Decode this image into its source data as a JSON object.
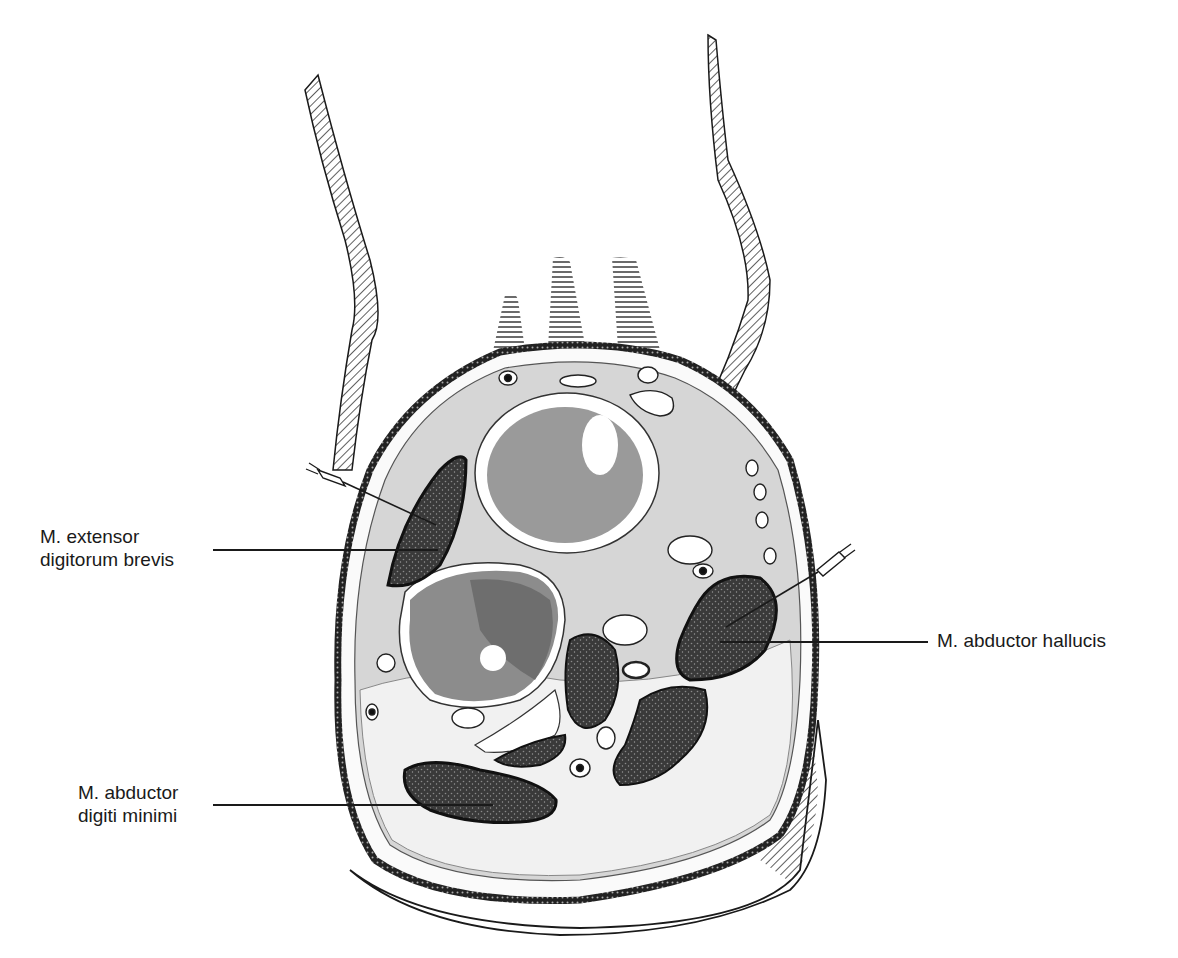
{
  "figure": {
    "colors": {
      "ink": "#1a1a1a",
      "muscle_fill": "#3a3a3a",
      "bone_fill": "#9a9a9a",
      "bone_dark": "#6e6e6e",
      "tissue_fill": "#d4d4d4",
      "fat_fill": "#f2f2f2",
      "background": "#ffffff"
    }
  },
  "labels": [
    {
      "id": "edb",
      "lines": [
        "M. extensor",
        "digitorum brevis"
      ]
    },
    {
      "id": "ah",
      "lines": [
        "M. abductor hallucis"
      ]
    },
    {
      "id": "adm",
      "lines": [
        "M. abductor",
        "digiti minimi"
      ]
    }
  ],
  "electrodes": [
    {
      "target": "M. extensor digitorum brevis",
      "side": "left"
    },
    {
      "target": "M. abductor hallucis",
      "side": "right"
    }
  ]
}
